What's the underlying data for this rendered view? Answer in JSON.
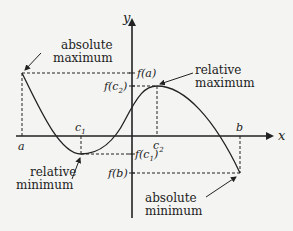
{
  "diagram": {
    "axes": {
      "x_label": "x",
      "y_label": "y"
    },
    "x_ticks": {
      "a": "a",
      "c1": "c",
      "c1_sub": "1",
      "c2": "c",
      "c2_sub": "2",
      "b": "b"
    },
    "y_ticks": {
      "fa": "f(a)",
      "fc2_pre": "f(c",
      "fc2_sub": "2",
      "fc2_post": ")",
      "fc1_pre": "f(c",
      "fc1_sub": "1",
      "fc1_post": ")",
      "fb": "f(b)"
    },
    "annotations": {
      "abs_max_line1": "absolute",
      "abs_max_line2": "maximum",
      "rel_max_line1": "relative",
      "rel_max_line2": "maximum",
      "rel_min_line1": "relative",
      "rel_min_line2": "minimum",
      "abs_min_line1": "absolute",
      "abs_min_line2": "minimum"
    },
    "colors": {
      "background": "#f4f4f2",
      "ink": "#222222"
    }
  }
}
